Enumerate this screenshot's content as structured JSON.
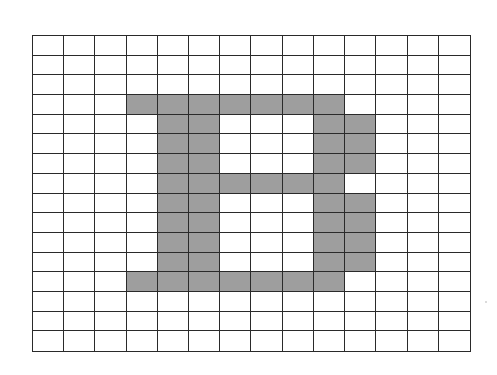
{
  "figure": {
    "letter": "B",
    "grid": {
      "columns": 14,
      "rows": 16,
      "line_color": "#2a2a2a",
      "empty_color": "#ffffff",
      "fill_color": "#9e9e9e"
    },
    "filled_cells": [
      [
        3,
        3
      ],
      [
        3,
        4
      ],
      [
        3,
        5
      ],
      [
        3,
        6
      ],
      [
        3,
        7
      ],
      [
        3,
        8
      ],
      [
        3,
        9
      ],
      [
        4,
        4
      ],
      [
        4,
        5
      ],
      [
        4,
        9
      ],
      [
        4,
        10
      ],
      [
        5,
        4
      ],
      [
        5,
        5
      ],
      [
        5,
        9
      ],
      [
        5,
        10
      ],
      [
        6,
        4
      ],
      [
        6,
        5
      ],
      [
        6,
        9
      ],
      [
        6,
        10
      ],
      [
        7,
        4
      ],
      [
        7,
        5
      ],
      [
        7,
        6
      ],
      [
        7,
        7
      ],
      [
        7,
        8
      ],
      [
        7,
        9
      ],
      [
        8,
        4
      ],
      [
        8,
        5
      ],
      [
        8,
        9
      ],
      [
        8,
        10
      ],
      [
        9,
        4
      ],
      [
        9,
        5
      ],
      [
        9,
        9
      ],
      [
        9,
        10
      ],
      [
        10,
        4
      ],
      [
        10,
        5
      ],
      [
        10,
        9
      ],
      [
        10,
        10
      ],
      [
        11,
        4
      ],
      [
        11,
        5
      ],
      [
        11,
        9
      ],
      [
        11,
        10
      ],
      [
        12,
        3
      ],
      [
        12,
        4
      ],
      [
        12,
        5
      ],
      [
        12,
        6
      ],
      [
        12,
        7
      ],
      [
        12,
        8
      ],
      [
        12,
        9
      ]
    ]
  }
}
